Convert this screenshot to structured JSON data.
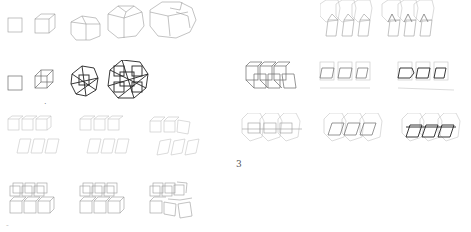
{
  "figure": {
    "panels": [
      {
        "id": "row1",
        "description": "cube growth sequence (outline, single to rhombic clusters)",
        "count": 5
      },
      {
        "id": "row2",
        "description": "cube growth sequence (wireframe, increasingly dense lattices)",
        "count": 4
      },
      {
        "id": "row3",
        "description": "2x3 slanted cube arrays, light",
        "count": 3
      },
      {
        "id": "row4",
        "description": "2x3 cube arrays, wireframe with distortion in last",
        "count": 3
      },
      {
        "id": "right-top",
        "description": "overlapping hexagonal prism rows",
        "count": 2
      },
      {
        "id": "right-mid",
        "description": "skewed cube rows with bold front faces",
        "count": 3
      },
      {
        "id": "right-bottom",
        "description": "hexagon overlays with skewed parallelograms",
        "count": 3
      }
    ],
    "labels": {
      "panel_number": "3",
      "small_mark": "·",
      "corner_mark": "-"
    }
  }
}
